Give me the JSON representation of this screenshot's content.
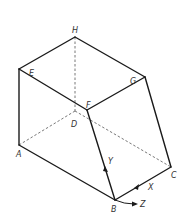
{
  "diagram": {
    "type": "isometric-solid",
    "vertices": {
      "H": {
        "label": "H",
        "x": 75,
        "y": 37
      },
      "E": {
        "label": "E",
        "x": 19,
        "y": 69
      },
      "G": {
        "label": "G",
        "x": 145,
        "y": 77
      },
      "F": {
        "label": "F",
        "x": 87,
        "y": 110
      },
      "D": {
        "label": "D",
        "x": 75,
        "y": 111
      },
      "A": {
        "label": "A",
        "x": 19,
        "y": 145
      },
      "C": {
        "label": "C",
        "x": 171,
        "y": 167
      },
      "B": {
        "label": "B",
        "x": 115,
        "y": 200
      }
    },
    "visible_edges": [
      "H-E",
      "H-G",
      "E-F",
      "G-F",
      "E-A",
      "A-B",
      "F-B",
      "G-C",
      "B-C"
    ],
    "hidden_edges": [
      "H-D",
      "D-A",
      "D-C"
    ],
    "axes": {
      "x": {
        "label": "X"
      },
      "y": {
        "label": "Y"
      },
      "z": {
        "label": "Z"
      }
    },
    "colors": {
      "line": "#1a1a1a",
      "hidden": "#555555",
      "label": "#333333"
    }
  }
}
